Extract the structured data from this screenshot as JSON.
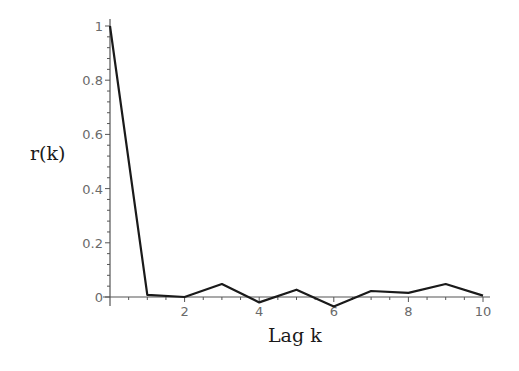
{
  "chart_data": {
    "type": "line",
    "title": "",
    "xlabel": "Lag k",
    "ylabel": "r(k)",
    "xlim": [
      0,
      10
    ],
    "ylim": [
      0,
      1
    ],
    "x_ticks": [
      2,
      4,
      6,
      8,
      10
    ],
    "x_tick_labels": [
      "2",
      "4",
      "6",
      "8",
      "10"
    ],
    "y_ticks": [
      0,
      0.2,
      0.4,
      0.6,
      0.8,
      1
    ],
    "y_tick_labels": [
      "0",
      "0.2",
      "0.4",
      "0.6",
      "0.8",
      "1"
    ],
    "grid": false,
    "legend": null,
    "series": [
      {
        "name": "r(k)",
        "x": [
          0,
          1,
          2,
          3,
          4,
          5,
          6,
          7,
          8,
          9,
          10
        ],
        "values": [
          1.0,
          0.008,
          0.0,
          0.048,
          -0.02,
          0.027,
          -0.035,
          0.022,
          0.015,
          0.048,
          0.005
        ],
        "color": "#1a1a1a"
      }
    ]
  },
  "labels": {
    "xlabel": "Lag k",
    "ylabel": "r(k)"
  }
}
